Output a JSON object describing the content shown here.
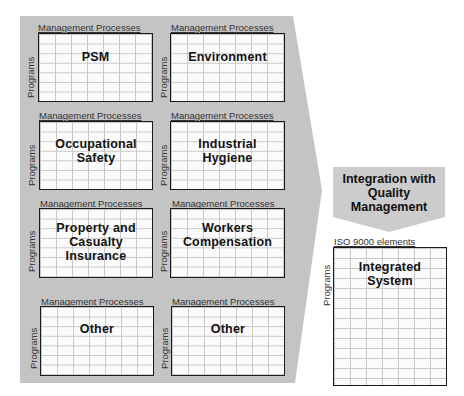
{
  "diagram": {
    "colors": {
      "background": "#ffffff",
      "funnel_fill": "#c4c4c4",
      "arrow_fill": "#cccccc",
      "box_border": "#1a1a1a",
      "grid_line": "#c9c9c9"
    },
    "column_axis_label": "Management Processes",
    "row_axis_label": "Programs",
    "program_boxes": [
      {
        "id": "psm",
        "title": "PSM",
        "column_label": "Management Processes",
        "row_label": "Programs"
      },
      {
        "id": "environment",
        "title": "Environment",
        "column_label": "Management Processes",
        "row_label": "Programs"
      },
      {
        "id": "occupational-safety",
        "title": "Occupational\nSafety",
        "column_label": "Management Processes",
        "row_label": "Programs"
      },
      {
        "id": "industrial-hygiene",
        "title": "Industrial\nHygiene",
        "column_label": "Management Processes",
        "row_label": "Programs"
      },
      {
        "id": "property-casualty",
        "title": "Property and\nCasualty\nInsurance",
        "column_label": "Management Processes",
        "row_label": "Programs"
      },
      {
        "id": "workers-compensation",
        "title": "Workers\nCompensation",
        "column_label": "Management Processes",
        "row_label": "Programs"
      },
      {
        "id": "other-1",
        "title": "Other",
        "column_label": "Management Processes",
        "row_label": "Programs"
      },
      {
        "id": "other-2",
        "title": "Other",
        "column_label": "Management Processes",
        "row_label": "Programs"
      }
    ],
    "integration_arrow": {
      "label": "Integration with\nQuality\nManagement"
    },
    "integrated_system": {
      "title": "Integrated\nSystem",
      "column_label": "ISO 9000 elements",
      "row_label": "Programs"
    }
  }
}
